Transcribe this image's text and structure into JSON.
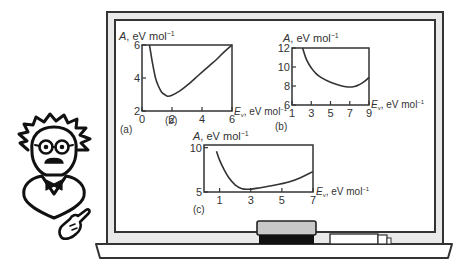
{
  "illustration": {
    "character": "professor with glasses and bow tie, pointing",
    "board": "blackboard with three plots"
  },
  "chart_data": [
    {
      "id": "a",
      "type": "line",
      "panel_label": "(a)",
      "inline_label": "(b)",
      "ylabel": "A, eV mol⁻¹",
      "ylabel_parts": {
        "sym": "A",
        "rest": ", eV mol",
        "sup": "−1"
      },
      "xlabel_parts": {
        "sym": "E",
        "sub": "v",
        "rest": ", eV mol",
        "sup": "−1"
      },
      "xlim": [
        0,
        6
      ],
      "ylim": [
        2,
        6
      ],
      "xticks": [
        0,
        2,
        4,
        6
      ],
      "yticks": [
        2,
        4,
        6
      ],
      "grid": false,
      "x": [
        0.5,
        0.7,
        0.9,
        1.1,
        1.3,
        1.5,
        1.7,
        2.0,
        2.5,
        3.0,
        3.5,
        4.0,
        4.5,
        5.0,
        5.5,
        6.0
      ],
      "y": [
        6.0,
        4.9,
        4.0,
        3.5,
        3.15,
        3.0,
        2.9,
        2.95,
        3.2,
        3.55,
        3.95,
        4.35,
        4.75,
        5.15,
        5.6,
        6.0
      ]
    },
    {
      "id": "b",
      "type": "line",
      "panel_label": "(b)",
      "ylabel_parts": {
        "sym": "A",
        "rest": ", eV mol",
        "sup": "−1"
      },
      "xlabel_parts": {
        "sym": "E",
        "sub": "v",
        "rest": ", eV mol",
        "sup": "−1"
      },
      "xlim": [
        1,
        9
      ],
      "ylim": [
        6,
        12
      ],
      "xticks": [
        1,
        3,
        5,
        7,
        9
      ],
      "yticks": [
        6,
        8,
        10,
        12
      ],
      "grid": false,
      "x": [
        2.1,
        2.5,
        3.0,
        3.5,
        4.0,
        5.0,
        6.0,
        6.8,
        7.5,
        8.0,
        8.5,
        9.0
      ],
      "y": [
        12.0,
        10.8,
        9.9,
        9.3,
        8.9,
        8.4,
        8.05,
        7.9,
        7.95,
        8.15,
        8.45,
        8.9
      ]
    },
    {
      "id": "c",
      "type": "line",
      "panel_label": "(c)",
      "ylabel_parts": {
        "sym": "A",
        "rest": ", eV mol",
        "sup": "−1"
      },
      "xlabel_parts": {
        "sym": "E",
        "sub": "v",
        "rest": ", eV mol",
        "sup": "−1"
      },
      "xlim": [
        0,
        7
      ],
      "ylim": [
        5,
        10.3
      ],
      "xticks": [
        1,
        3,
        5,
        7
      ],
      "yticks": [
        5,
        10
      ],
      "grid": false,
      "x": [
        0.8,
        1.0,
        1.3,
        1.6,
        2.0,
        2.4,
        2.8,
        3.5,
        4.5,
        5.5,
        6.2,
        7.0
      ],
      "y": [
        9.6,
        8.6,
        7.5,
        6.6,
        5.8,
        5.4,
        5.3,
        5.45,
        5.75,
        6.15,
        6.6,
        7.3
      ]
    }
  ]
}
